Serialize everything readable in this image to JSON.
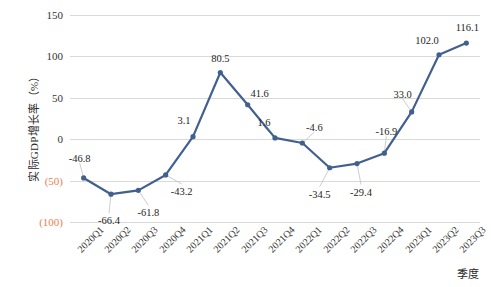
{
  "chart_data": {
    "type": "line",
    "title": "",
    "xlabel": "季度",
    "ylabel": "实际GDP增长率（%）",
    "ylim": [
      -100,
      150
    ],
    "ytick_values": [
      150,
      100,
      50,
      0,
      -50,
      -100
    ],
    "ytick_labels": [
      "150",
      "100",
      "50",
      "0",
      "(50)",
      "(100)"
    ],
    "grid": "horizontal",
    "legend": "none",
    "categories": [
      "2020Q1",
      "2020Q2",
      "2020Q3",
      "2020Q4",
      "2021Q1",
      "2021Q2",
      "2021Q3",
      "2021Q4",
      "2022Q1",
      "2022Q2",
      "2022Q3",
      "2022Q4",
      "2023Q1",
      "2023Q2",
      "2023Q3"
    ],
    "values": [
      -46.8,
      -66.4,
      -61.8,
      -43.2,
      3.1,
      80.5,
      41.6,
      1.6,
      -4.6,
      -34.5,
      -29.4,
      -16.9,
      33.0,
      102.0,
      116.1
    ],
    "data_labels": [
      "-46.8",
      "-66.4",
      "-61.8",
      "-43.2",
      "3.1",
      "80.5",
      "41.6",
      "1.6",
      "-4.6",
      "-34.5",
      "-29.4",
      "-16.9",
      "33.0",
      "102.0",
      "116.1"
    ],
    "series_color": "#41608F",
    "marker_color": "#41608F",
    "grid_color": "#D9D9D9",
    "negative_tick_color": "#ED7D52"
  },
  "axes": {
    "y_title": "实际GDP增长率（%）",
    "x_title": "季度"
  }
}
